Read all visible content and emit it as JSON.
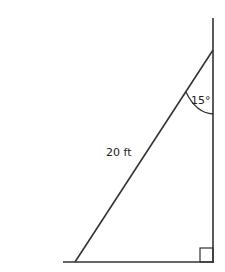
{
  "diagram": {
    "type": "right-triangle",
    "hypotenuse_label": "20 ft",
    "angle_label": "15°",
    "right_angle_marker": true,
    "line_color": "#333333",
    "background": "#ffffff"
  }
}
